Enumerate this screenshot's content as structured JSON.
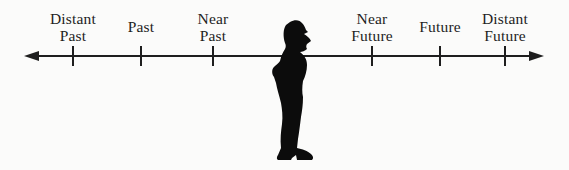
{
  "diagram": {
    "background": "#fbfbfa",
    "ink": "#1e1e1e",
    "axis": {
      "orientation": "horizontal",
      "arrow_left": true,
      "arrow_right": true
    },
    "ticks": [
      {
        "id": "distant-past",
        "label": "Distant Past",
        "lines": [
          "Distant",
          "Past"
        ],
        "x": 73
      },
      {
        "id": "past",
        "label": "Past",
        "lines": [
          "Past"
        ],
        "x": 141
      },
      {
        "id": "near-past",
        "label": "Near Past",
        "lines": [
          "Near",
          "Past"
        ],
        "x": 213
      },
      {
        "id": "near-future",
        "label": "Near Future",
        "lines": [
          "Near",
          "Future"
        ],
        "x": 372
      },
      {
        "id": "future",
        "label": "Future",
        "lines": [
          "Future"
        ],
        "x": 440
      },
      {
        "id": "distant-future",
        "label": "Distant Future",
        "lines": [
          "Distant",
          "Future"
        ],
        "x": 505
      }
    ],
    "icons": {
      "center_figure": "person-silhouette",
      "left_end": "left-arrowhead",
      "right_end": "right-arrowhead"
    }
  }
}
